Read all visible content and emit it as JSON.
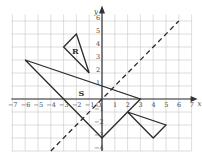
{
  "diagram": {
    "type": "coordinate-grid",
    "x_range": [
      -7,
      7
    ],
    "y_range": [
      -4,
      6
    ],
    "x_axis_label": "x",
    "y_axis_label": "y",
    "origin_label": "O",
    "x_ticks": [
      -7,
      -6,
      -5,
      -4,
      -3,
      -2,
      -1,
      1,
      2,
      3,
      4,
      5,
      6,
      7
    ],
    "y_ticks": [
      -4,
      -3,
      -2,
      -1,
      1,
      2,
      3,
      4,
      5,
      6
    ],
    "shapes": [
      {
        "name": "R",
        "label": "R",
        "vertices": [
          [
            -3,
            4
          ],
          [
            -2,
            5
          ],
          [
            -1,
            2
          ]
        ],
        "label_pos": [
          -2.1,
          3.7
        ]
      },
      {
        "name": "S",
        "label": "S",
        "vertices": [
          [
            -6,
            3
          ],
          [
            3,
            0
          ],
          [
            0,
            -3
          ]
        ],
        "label_pos": [
          -1.6,
          0.45
        ]
      },
      {
        "name": "T",
        "label": "",
        "vertices": [
          [
            2,
            -1
          ],
          [
            5,
            -2
          ],
          [
            4,
            -3
          ]
        ],
        "label_pos": null
      }
    ],
    "mirror_line": {
      "equation": "y = x",
      "style": "dashed",
      "from": [
        -4,
        -4
      ],
      "to": [
        6,
        6
      ]
    }
  },
  "colors": {
    "background": "#ffffff",
    "grid": "#c8c8c8",
    "axis": "#333333",
    "shape_stroke": "#2a2a2a"
  }
}
